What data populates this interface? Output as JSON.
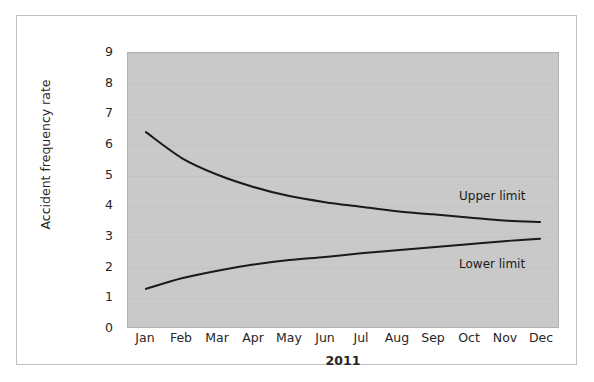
{
  "chart_data": {
    "type": "line",
    "title": "",
    "subtitle": "",
    "xlabel": "2011",
    "ylabel": "Accident frequency rate",
    "categories": [
      "Jan",
      "Feb",
      "Mar",
      "Apr",
      "May",
      "Jun",
      "Jul",
      "Aug",
      "Sep",
      "Oct",
      "Nov",
      "Dec"
    ],
    "ylim": [
      0,
      9
    ],
    "yticks": [
      9,
      8,
      7,
      6,
      5,
      4,
      3,
      2,
      1,
      0
    ],
    "grid": true,
    "legend_position": "inline-annotations",
    "series": [
      {
        "name": "Upper limit",
        "values": [
          6.4,
          5.55,
          5.0,
          4.6,
          4.3,
          4.1,
          3.95,
          3.8,
          3.7,
          3.6,
          3.5,
          3.45
        ],
        "color": "#1a1a1a",
        "annotation": "Upper limit"
      },
      {
        "name": "Lower limit",
        "values": [
          1.25,
          1.6,
          1.85,
          2.05,
          2.2,
          2.3,
          2.42,
          2.52,
          2.62,
          2.72,
          2.82,
          2.9
        ],
        "color": "#1a1a1a",
        "annotation": "Lower limit"
      }
    ],
    "annotations": [
      {
        "text": "Upper limit"
      },
      {
        "text": "Lower limit"
      }
    ]
  },
  "axis": {
    "y_title": "Accident frequency rate",
    "x_title": "2011",
    "y_tick_labels": [
      "9",
      "8",
      "7",
      "6",
      "5",
      "4",
      "3",
      "2",
      "1",
      "0"
    ],
    "x_tick_labels": [
      "Jan",
      "Feb",
      "Mar",
      "Apr",
      "May",
      "Jun",
      "Jul",
      "Aug",
      "Sep",
      "Oct",
      "Nov",
      "Dec"
    ]
  },
  "labels": {
    "upper_limit": "Upper limit",
    "lower_limit": "Lower limit"
  },
  "colors": {
    "plot_background": "#c9c9c9",
    "line": "#1a1a1a",
    "gridline": "#c3c3c3",
    "frame_border": "#c0c0c0",
    "text": "#262626",
    "page_background": "#ffffff"
  }
}
